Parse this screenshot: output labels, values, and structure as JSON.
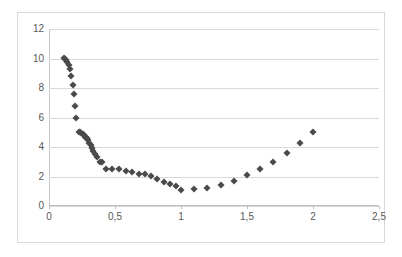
{
  "chart_data": {
    "type": "scatter",
    "title": "",
    "xlabel": "",
    "ylabel": "",
    "xlim": [
      0,
      2.5
    ],
    "ylim": [
      0,
      12
    ],
    "xticks": [
      0,
      0.5,
      1,
      1.5,
      2,
      2.5
    ],
    "xtick_labels": [
      "0",
      "0,5",
      "1",
      "1,5",
      "2",
      "2,5"
    ],
    "yticks": [
      0,
      2,
      4,
      6,
      8,
      10,
      12
    ],
    "ytick_labels": [
      "0",
      "2",
      "4",
      "6",
      "8",
      "10",
      "12"
    ],
    "grid": "horizontal",
    "legend": "none",
    "decimal_separator": ",",
    "marker": "diamond",
    "marker_color": "#4a4a4a",
    "grid_color": "#d9d9d9",
    "border_color": "#d9d9d9",
    "axis_color": "#c0c0c0",
    "tick_label_color": "#595959",
    "series": [
      {
        "name": "series-1",
        "points": [
          [
            0.11,
            10.05
          ],
          [
            0.12,
            10.0
          ],
          [
            0.13,
            9.9
          ],
          [
            0.14,
            9.75
          ],
          [
            0.15,
            9.55
          ],
          [
            0.16,
            9.3
          ],
          [
            0.17,
            8.8
          ],
          [
            0.18,
            8.2
          ],
          [
            0.19,
            7.6
          ],
          [
            0.2,
            6.8
          ],
          [
            0.205,
            5.95
          ],
          [
            0.225,
            5.0
          ],
          [
            0.235,
            5.0
          ],
          [
            0.245,
            4.95
          ],
          [
            0.255,
            4.88
          ],
          [
            0.265,
            4.8
          ],
          [
            0.275,
            4.7
          ],
          [
            0.285,
            4.58
          ],
          [
            0.295,
            4.45
          ],
          [
            0.305,
            4.3
          ],
          [
            0.315,
            4.12
          ],
          [
            0.325,
            3.95
          ],
          [
            0.335,
            3.75
          ],
          [
            0.345,
            3.55
          ],
          [
            0.36,
            3.35
          ],
          [
            0.385,
            2.98
          ],
          [
            0.4,
            2.95
          ],
          [
            0.43,
            2.52
          ],
          [
            0.48,
            2.5
          ],
          [
            0.53,
            2.48
          ],
          [
            0.58,
            2.4
          ],
          [
            0.63,
            2.3
          ],
          [
            0.68,
            2.2
          ],
          [
            0.73,
            2.18
          ],
          [
            0.77,
            2.02
          ],
          [
            0.82,
            1.82
          ],
          [
            0.87,
            1.62
          ],
          [
            0.92,
            1.52
          ],
          [
            0.96,
            1.35
          ],
          [
            1.0,
            1.08
          ],
          [
            1.1,
            1.12
          ],
          [
            1.2,
            1.25
          ],
          [
            1.3,
            1.45
          ],
          [
            1.4,
            1.72
          ],
          [
            1.5,
            2.08
          ],
          [
            1.6,
            2.5
          ],
          [
            1.7,
            3.0
          ],
          [
            1.8,
            3.58
          ],
          [
            1.9,
            4.25
          ],
          [
            2.0,
            5.05
          ]
        ]
      }
    ]
  }
}
